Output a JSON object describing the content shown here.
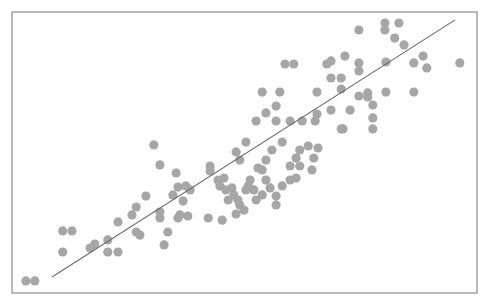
{
  "chart_data": {
    "type": "scatter",
    "title": "",
    "xlabel": "",
    "ylabel": "",
    "xlim": [
      0,
      100
    ],
    "ylim": [
      0,
      100
    ],
    "grid": false,
    "legend": null,
    "axes_ticks_visible": false,
    "note": "No axis ticks or labels are rendered; coordinates are normalized to the plot frame (x: left=0 → right=100, y: bottom=0 → top=100).",
    "colors": {
      "points": "#a6a6a6",
      "fit_line": "#6a6a6a",
      "frame": "#8a8a8a",
      "background": "#ffffff"
    },
    "frame_px": {
      "left": 12,
      "top": 12,
      "right": 477,
      "bottom": 293
    },
    "point_radius_px": 4.6,
    "fit_line": {
      "x": [
        8.6,
        95.3
      ],
      "y": [
        5.7,
        97.2
      ]
    },
    "series": [
      {
        "name": "points",
        "points": [
          [
            3.0,
            4.3
          ],
          [
            4.9,
            4.3
          ],
          [
            10.9,
            22.1
          ],
          [
            12.9,
            22.1
          ],
          [
            10.9,
            14.6
          ],
          [
            17.8,
            17.4
          ],
          [
            16.8,
            16.0
          ],
          [
            20.6,
            14.6
          ],
          [
            22.8,
            14.6
          ],
          [
            20.6,
            18.9
          ],
          [
            22.8,
            25.3
          ],
          [
            26.7,
            30.6
          ],
          [
            28.8,
            34.5
          ],
          [
            26.7,
            21.7
          ],
          [
            27.5,
            20.6
          ],
          [
            25.8,
            27.8
          ],
          [
            31.8,
            28.8
          ],
          [
            32.7,
            17.1
          ],
          [
            34.6,
            34.9
          ],
          [
            36.1,
            27.8
          ],
          [
            35.7,
            37.7
          ],
          [
            36.8,
            32.7
          ],
          [
            30.5,
            52.7
          ],
          [
            31.8,
            45.6
          ],
          [
            35.3,
            42.7
          ],
          [
            37.4,
            38.1
          ],
          [
            38.3,
            36.7
          ],
          [
            42.6,
            45.2
          ],
          [
            42.6,
            43.4
          ],
          [
            44.3,
            40.2
          ],
          [
            45.6,
            40.9
          ],
          [
            44.7,
            38.1
          ],
          [
            46.0,
            36.7
          ],
          [
            47.3,
            37.4
          ],
          [
            47.7,
            34.9
          ],
          [
            48.6,
            33.1
          ],
          [
            49.0,
            31.3
          ],
          [
            50.3,
            36.7
          ],
          [
            51.2,
            40.2
          ],
          [
            50.8,
            38.1
          ],
          [
            52.0,
            36.7
          ],
          [
            52.5,
            33.1
          ],
          [
            53.8,
            34.9
          ],
          [
            54.6,
            40.2
          ],
          [
            55.5,
            37.4
          ],
          [
            56.8,
            34.5
          ],
          [
            58.1,
            38.1
          ],
          [
            59.8,
            40.2
          ],
          [
            61.1,
            40.9
          ],
          [
            59.8,
            45.2
          ],
          [
            61.1,
            48.0
          ],
          [
            61.9,
            50.9
          ],
          [
            63.7,
            52.3
          ],
          [
            65.8,
            51.6
          ],
          [
            54.6,
            47.3
          ],
          [
            55.9,
            50.9
          ],
          [
            58.1,
            53.7
          ],
          [
            52.9,
            44.5
          ],
          [
            53.8,
            43.8
          ],
          [
            46.5,
            33.1
          ],
          [
            49.9,
            29.5
          ],
          [
            48.2,
            28.1
          ],
          [
            45.2,
            25.9
          ],
          [
            42.2,
            26.7
          ],
          [
            37.8,
            27.4
          ],
          [
            35.7,
            26.7
          ],
          [
            33.5,
            21.7
          ],
          [
            31.8,
            26.7
          ],
          [
            48.2,
            50.2
          ],
          [
            50.3,
            53.7
          ],
          [
            49.0,
            47.3
          ],
          [
            61.9,
            45.2
          ],
          [
            64.5,
            43.8
          ],
          [
            64.9,
            48.0
          ],
          [
            56.8,
            31.3
          ],
          [
            58.7,
            81.5
          ],
          [
            60.6,
            81.5
          ],
          [
            53.8,
            71.5
          ],
          [
            57.6,
            71.5
          ],
          [
            56.8,
            66.5
          ],
          [
            54.6,
            64.1
          ],
          [
            52.5,
            61.2
          ],
          [
            56.8,
            61.2
          ],
          [
            59.8,
            61.2
          ],
          [
            62.4,
            61.2
          ],
          [
            65.2,
            61.2
          ],
          [
            74.6,
            93.6
          ],
          [
            80.2,
            96.1
          ],
          [
            80.2,
            93.6
          ],
          [
            83.2,
            96.1
          ],
          [
            82.3,
            90.7
          ],
          [
            84.3,
            88.3
          ],
          [
            67.7,
            81.5
          ],
          [
            68.6,
            82.6
          ],
          [
            71.6,
            84.3
          ],
          [
            74.6,
            81.9
          ],
          [
            74.6,
            79.0
          ],
          [
            80.4,
            82.2
          ],
          [
            86.4,
            81.9
          ],
          [
            88.4,
            84.3
          ],
          [
            89.2,
            80.1
          ],
          [
            96.3,
            81.9
          ],
          [
            68.6,
            76.5
          ],
          [
            70.8,
            76.5
          ],
          [
            65.6,
            71.5
          ],
          [
            70.8,
            72.6
          ],
          [
            74.6,
            70.1
          ],
          [
            76.5,
            71.2
          ],
          [
            76.5,
            69.8
          ],
          [
            77.6,
            66.9
          ],
          [
            80.4,
            71.5
          ],
          [
            86.4,
            71.5
          ],
          [
            65.6,
            63.7
          ],
          [
            68.6,
            65.1
          ],
          [
            72.7,
            65.1
          ],
          [
            77.6,
            62.3
          ],
          [
            70.8,
            58.4
          ],
          [
            71.2,
            58.4
          ],
          [
            77.6,
            58.4
          ]
        ]
      }
    ]
  }
}
